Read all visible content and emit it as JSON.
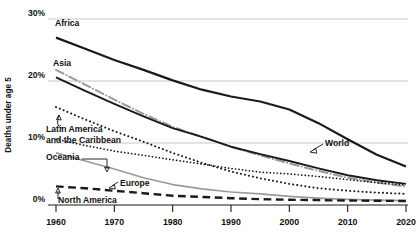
{
  "chart_data": {
    "type": "line",
    "title": "",
    "subtitle": "",
    "xlabel": "",
    "ylabel": "Deaths under age 5",
    "xlim": [
      1960,
      2020
    ],
    "ylim": [
      0,
      30
    ],
    "grid": true,
    "legend_position": "inline-annotations",
    "x": [
      1960,
      1965,
      1970,
      1975,
      1980,
      1985,
      1990,
      1995,
      2000,
      2005,
      2010,
      2015,
      2020
    ],
    "y_ticks": [
      "0%",
      "10%",
      "20%",
      "30%"
    ],
    "y_tick_values": [
      0,
      10,
      20,
      30
    ],
    "x_ticks": [
      "1960",
      "1970",
      "1980",
      "1990",
      "2000",
      "2010",
      "2020"
    ],
    "x_tick_values": [
      1960,
      1970,
      1980,
      1990,
      2000,
      2010,
      2020
    ],
    "series": [
      {
        "name": "Africa",
        "label": "Africa",
        "style": "solid",
        "color": "#1a1a1a",
        "width": 2.2,
        "values": [
          27.0,
          25.2,
          23.4,
          21.8,
          20.1,
          18.6,
          17.5,
          16.7,
          15.4,
          13.2,
          10.6,
          8.1,
          6.2
        ]
      },
      {
        "name": "Asia",
        "label": "Asia",
        "style": "dash-dot",
        "color": "#9a9a9a",
        "width": 2.0,
        "values": [
          21.8,
          19.4,
          17.0,
          14.7,
          12.6,
          11.0,
          9.4,
          8.0,
          6.7,
          5.5,
          4.4,
          3.6,
          3.0
        ]
      },
      {
        "name": "World",
        "label": "World",
        "style": "solid",
        "color": "#1a1a1a",
        "width": 1.9,
        "values": [
          20.6,
          18.4,
          16.3,
          14.3,
          12.4,
          11.0,
          9.4,
          8.2,
          7.1,
          5.9,
          4.8,
          4.0,
          3.4
        ]
      },
      {
        "name": "Latin America and the Caribbean",
        "label": "Latin America and the Caribbean",
        "style": "dotted",
        "color": "#1a1a1a",
        "width": 2.0,
        "values": [
          15.8,
          13.8,
          11.9,
          10.2,
          8.4,
          6.8,
          5.4,
          4.3,
          3.4,
          2.7,
          2.3,
          2.0,
          1.8
        ]
      },
      {
        "name": "Oceania",
        "label": "Oceania",
        "style": "dotted",
        "color": "#1a1a1a",
        "width": 1.7,
        "values": [
          10.6,
          9.6,
          8.7,
          8.0,
          7.3,
          6.6,
          5.9,
          5.3,
          5.0,
          4.6,
          4.1,
          3.6,
          3.2
        ]
      },
      {
        "name": "Europe",
        "label": "Europe",
        "style": "solid",
        "color": "#9a9a9a",
        "width": 1.7,
        "values": [
          8.4,
          7.1,
          5.8,
          4.4,
          3.3,
          2.6,
          2.1,
          1.8,
          1.4,
          1.1,
          0.9,
          0.8,
          0.7
        ]
      },
      {
        "name": "North America",
        "label": "North America",
        "style": "dashed",
        "color": "#1a1a1a",
        "width": 2.4,
        "values": [
          3.0,
          2.7,
          2.3,
          1.9,
          1.5,
          1.3,
          1.1,
          0.95,
          0.85,
          0.78,
          0.72,
          0.68,
          0.64
        ]
      }
    ],
    "annotations": [
      {
        "name": "africa-label",
        "text": "Africa",
        "x_px": 55,
        "y_px": 26
      },
      {
        "name": "asia-label",
        "text": "Asia",
        "x_px": 53,
        "y_px": 66
      },
      {
        "name": "latin-america-label-line1",
        "text": "Latin America",
        "x_px": 46,
        "y_px": 132
      },
      {
        "name": "latin-america-label-line2",
        "text": "and the Caribbean",
        "x_px": 46,
        "y_px": 143
      },
      {
        "name": "oceania-label",
        "text": "Oceania",
        "x_px": 46,
        "y_px": 160
      },
      {
        "name": "europe-label",
        "text": "Europe",
        "x_px": 120,
        "y_px": 186
      },
      {
        "name": "north-america-label",
        "text": "North America",
        "x_px": 58,
        "y_px": 203
      },
      {
        "name": "world-label",
        "text": "World",
        "x_px": 325,
        "y_px": 146
      }
    ]
  },
  "axis": {
    "y_title": "Deaths under age 5"
  }
}
